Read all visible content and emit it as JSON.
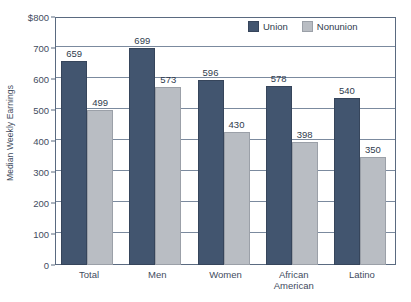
{
  "chart_data": {
    "type": "bar",
    "title": "",
    "xlabel": "",
    "ylabel": "Median Weekly Earnings",
    "categories": [
      "Total",
      "Men",
      "Women",
      "African\nAmerican",
      "Latino"
    ],
    "series": [
      {
        "name": "Union",
        "color": "#42556f",
        "values": [
          659,
          699,
          596,
          578,
          540
        ]
      },
      {
        "name": "Nonunion",
        "color": "#b9bdc3",
        "values": [
          499,
          573,
          430,
          398,
          350
        ]
      }
    ],
    "ylim": [
      0,
      800
    ],
    "ytick_values": [
      0,
      100,
      200,
      300,
      400,
      500,
      600,
      700,
      800
    ],
    "ytick_labels": [
      "0",
      "100",
      "200",
      "300",
      "400",
      "500",
      "600",
      "700",
      "$800"
    ],
    "grid": true,
    "legend_position": "top-right",
    "data_labels": true
  },
  "legend": {
    "items": [
      {
        "label": "Union",
        "swatch": "union-swatch"
      },
      {
        "label": "Nonunion",
        "swatch": "nonunion-swatch"
      }
    ]
  },
  "axis": {
    "y_title": "Median Weekly Earnings"
  }
}
